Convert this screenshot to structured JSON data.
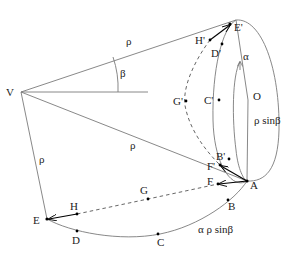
{
  "diagram": {
    "labels": {
      "V": "V",
      "rho_top": "ρ",
      "rho_mid": "ρ",
      "rho_left": "ρ",
      "beta": "β",
      "alpha": "α",
      "O": "O",
      "rho_sin_beta": "ρ sinβ",
      "arc_length": "α ρ sinβ",
      "E_prime": "E'",
      "H_prime": "H'",
      "D_prime": "D'",
      "C_prime": "C'",
      "G_prime": "G'",
      "B_prime": "B'",
      "F_prime": "F'",
      "A": "A",
      "F": "F",
      "B": "B",
      "C": "C",
      "D": "D",
      "E": "E",
      "G": "G",
      "H": "H"
    },
    "points": {
      "V": [
        21,
        92
      ],
      "E_prime": [
        230,
        24
      ],
      "A": [
        247,
        181
      ],
      "E": [
        47,
        219
      ],
      "H": [
        77,
        214
      ],
      "D": [
        77,
        231
      ],
      "C": [
        158,
        234
      ],
      "B": [
        228,
        200
      ],
      "G": [
        148,
        199
      ],
      "F": [
        218,
        184
      ],
      "F_prime": [
        220,
        165
      ],
      "B_prime": [
        229,
        159
      ],
      "H_prime": [
        210,
        40
      ],
      "D_prime": [
        222,
        44
      ],
      "C_prime": [
        219,
        100
      ],
      "G_prime": [
        186,
        101
      ]
    },
    "colors": {
      "lines": "#7a7a7a",
      "points": "#000000",
      "text": "#222222",
      "background": "#ffffff"
    }
  }
}
